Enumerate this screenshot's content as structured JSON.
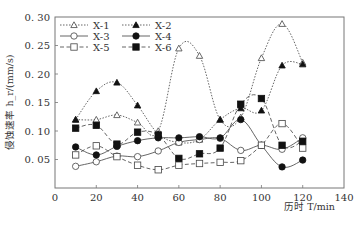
{
  "chart_data": {
    "type": "line",
    "title": "",
    "xlabel": "历时 T/min",
    "ylabel": "侵蚀速率 h_r/(mm/s)",
    "xlim": [
      0,
      140
    ],
    "ylim": [
      0,
      0.3
    ],
    "xticks": [
      0,
      20,
      40,
      60,
      80,
      100,
      120,
      140
    ],
    "yticks": [
      0.05,
      0.1,
      0.15,
      0.2,
      0.25,
      0.3
    ],
    "ytick_labels": [
      "0. 05",
      "0. 10",
      "0. 15",
      "0. 20",
      "0. 25",
      "0. 30"
    ],
    "grid": false,
    "legend_position": "upper-left",
    "x": [
      10,
      20,
      30,
      40,
      50,
      60,
      70,
      80,
      90,
      100,
      110,
      120
    ],
    "series": [
      {
        "name": "X-1",
        "marker": "open-triangle",
        "line": "dotted",
        "values": [
          0.12,
          0.12,
          0.128,
          0.115,
          0.1,
          0.245,
          0.232,
          0.12,
          0.124,
          0.228,
          0.288,
          0.22
        ]
      },
      {
        "name": "X-2",
        "marker": "filled-triangle",
        "line": "dotted",
        "values": [
          0.12,
          0.17,
          0.185,
          0.145,
          0.095,
          0.08,
          0.085,
          0.12,
          0.14,
          0.136,
          0.215,
          0.217
        ]
      },
      {
        "name": "X-3",
        "marker": "open-circle",
        "line": "solid",
        "values": [
          0.038,
          0.046,
          0.056,
          0.055,
          0.065,
          0.08,
          0.085,
          0.087,
          0.066,
          0.075,
          0.068,
          0.088
        ]
      },
      {
        "name": "X-4",
        "marker": "filled-circle",
        "line": "solid",
        "values": [
          0.072,
          0.058,
          0.073,
          0.083,
          0.088,
          0.088,
          0.09,
          0.088,
          0.12,
          0.075,
          0.037,
          0.049
        ]
      },
      {
        "name": "X-5",
        "marker": "open-square",
        "line": "dashed",
        "values": [
          0.058,
          0.074,
          0.055,
          0.04,
          0.032,
          0.04,
          0.043,
          0.045,
          0.048,
          0.075,
          0.113,
          0.07
        ]
      },
      {
        "name": "X-6",
        "marker": "filled-square",
        "line": "dashed",
        "values": [
          0.105,
          0.11,
          0.077,
          0.098,
          0.093,
          0.052,
          0.06,
          0.07,
          0.147,
          0.157,
          0.075,
          0.082
        ]
      }
    ]
  },
  "legend": {
    "items": [
      "X-1",
      "X-2",
      "X-3",
      "X-4",
      "X-5",
      "X-6"
    ]
  },
  "colors": {
    "line": "#555555",
    "axis": "#666666",
    "marker_fill": "#111111"
  }
}
